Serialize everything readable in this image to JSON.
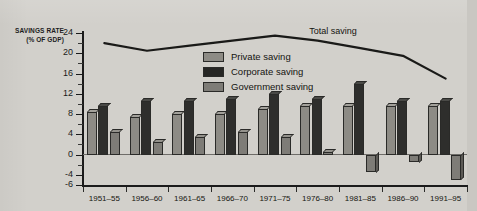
{
  "axis_title": {
    "line1": "SAVINGS RATE",
    "line2": "(% OF GDP)"
  },
  "legend": {
    "items": [
      {
        "label": "Private saving",
        "key": "private",
        "color": "#8d8b85"
      },
      {
        "label": "Corporate saving",
        "key": "corporate",
        "color": "#262624"
      },
      {
        "label": "Government saving",
        "key": "government",
        "color": "#7e7c77"
      }
    ]
  },
  "line_annotation": "Total saving",
  "y_ticks": [
    "24",
    "20",
    "16",
    "12",
    "8",
    "4",
    "0",
    "-4",
    "-6"
  ],
  "chart_data": {
    "type": "bar",
    "title": "",
    "subtitle": "",
    "xlabel": "",
    "ylabel": "SAVINGS RATE (% OF GDP)",
    "ylim": [
      -6,
      24
    ],
    "ytick_values": [
      24,
      20,
      16,
      12,
      8,
      4,
      0,
      -4,
      -6
    ],
    "grid": false,
    "legend_position": "inside-top-center",
    "categories": [
      "1951-55",
      "1956-60",
      "1961-65",
      "1966-70",
      "1971-75",
      "1976-80",
      "1981-85",
      "1986-90",
      "1991-95"
    ],
    "series": [
      {
        "name": "Private saving",
        "type": "bar",
        "color": "#8d8b85",
        "values": [
          8.5,
          7.5,
          8.0,
          8.0,
          9.0,
          9.5,
          9.5,
          9.5,
          9.5
        ]
      },
      {
        "name": "Corporate saving",
        "type": "bar",
        "color": "#262624",
        "values": [
          9.5,
          10.5,
          10.5,
          11.0,
          12.0,
          11.0,
          14.0,
          10.5,
          10.5
        ]
      },
      {
        "name": "Government saving",
        "type": "bar",
        "color": "#7e7c77",
        "values": [
          4.5,
          2.5,
          3.5,
          4.5,
          3.5,
          0.5,
          -3.5,
          -1.5,
          -5.0
        ]
      },
      {
        "name": "Total saving",
        "type": "line",
        "color": "#1a1a18",
        "values": [
          22.0,
          20.5,
          21.5,
          22.5,
          23.5,
          22.5,
          21.0,
          19.5,
          15.0
        ]
      }
    ]
  }
}
